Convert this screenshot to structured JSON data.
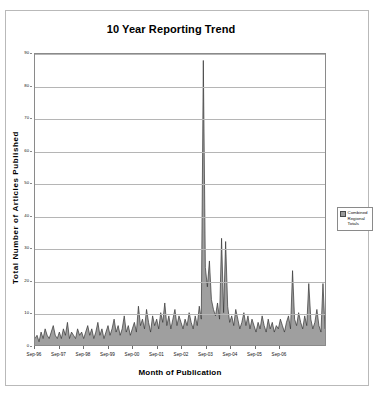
{
  "chart_data": {
    "type": "area",
    "title": "10 Year Reporting Trend",
    "xlabel": "Month of Publication",
    "ylabel": "Total Number of Articles Published",
    "ylim": [
      0,
      90
    ],
    "y_ticks": [
      0,
      10,
      20,
      30,
      40,
      50,
      60,
      70,
      80,
      90
    ],
    "grid": true,
    "legend_position": "right",
    "series": [
      {
        "name": "Combined Regional Totals",
        "color": "#9a9a9a",
        "line_color": "#333333",
        "values": [
          2,
          3,
          1,
          4,
          2,
          5,
          3,
          2,
          4,
          6,
          3,
          2,
          4,
          2,
          5,
          3,
          7,
          2,
          4,
          3,
          2,
          5,
          3,
          4,
          2,
          4,
          6,
          3,
          5,
          2,
          4,
          7,
          3,
          5,
          2,
          4,
          6,
          3,
          5,
          8,
          4,
          6,
          3,
          5,
          9,
          4,
          6,
          3,
          5,
          7,
          4,
          12,
          6,
          8,
          5,
          11,
          7,
          4,
          9,
          6,
          8,
          5,
          10,
          7,
          13,
          6,
          9,
          5,
          8,
          11,
          6,
          9,
          7,
          5,
          8,
          6,
          10,
          7,
          5,
          9,
          6,
          12,
          8,
          88,
          24,
          18,
          26,
          14,
          11,
          9,
          13,
          8,
          33,
          10,
          32,
          12,
          7,
          9,
          6,
          11,
          8,
          5,
          7,
          10,
          6,
          9,
          5,
          8,
          6,
          4,
          7,
          5,
          9,
          6,
          4,
          8,
          5,
          7,
          4,
          6,
          5,
          8,
          6,
          4,
          7,
          9,
          5,
          23,
          8,
          6,
          10,
          7,
          5,
          9,
          6,
          19,
          8,
          5,
          7,
          11,
          6,
          4,
          19,
          5
        ]
      }
    ],
    "x_tick_labels": [
      "Sep-96",
      "Sep-97",
      "Sep-98",
      "Sep-99",
      "Sep-00",
      "Sep-01",
      "Sep-02",
      "Sep-03",
      "Sep-04",
      "Sep-05",
      "Sep-06"
    ],
    "x_tick_positions": [
      0,
      12,
      24,
      36,
      48,
      60,
      72,
      84,
      96,
      108,
      120
    ]
  },
  "legend": {
    "entries": [
      {
        "line1": "Combined",
        "line2": "Regional",
        "line3": "Totals"
      }
    ]
  }
}
